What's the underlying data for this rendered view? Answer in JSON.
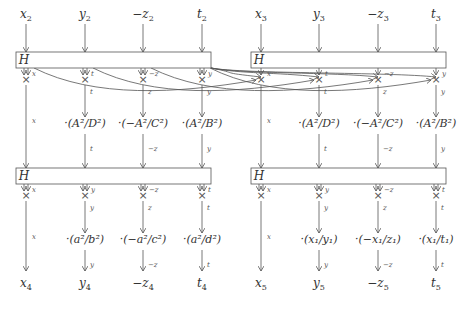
{
  "diagram": {
    "title": "",
    "columns_x": [
      26,
      85,
      143,
      202,
      261,
      319,
      378,
      436
    ],
    "inputs": [
      {
        "main": "x",
        "sub": "2",
        "neg": false
      },
      {
        "main": "y",
        "sub": "2",
        "neg": false
      },
      {
        "main": "z",
        "sub": "2",
        "neg": true
      },
      {
        "main": "t",
        "sub": "2",
        "neg": false
      },
      {
        "main": "x",
        "sub": "3",
        "neg": false
      },
      {
        "main": "y",
        "sub": "3",
        "neg": false
      },
      {
        "main": "z",
        "sub": "3",
        "neg": true
      },
      {
        "main": "t",
        "sub": "3",
        "neg": false
      }
    ],
    "outputs": [
      {
        "main": "x",
        "sub": "4",
        "neg": false
      },
      {
        "main": "y",
        "sub": "4",
        "neg": false
      },
      {
        "main": "z",
        "sub": "4",
        "neg": true
      },
      {
        "main": "t",
        "sub": "4",
        "neg": false
      },
      {
        "main": "x",
        "sub": "5",
        "neg": false
      },
      {
        "main": "y",
        "sub": "5",
        "neg": false
      },
      {
        "main": "z",
        "sub": "5",
        "neg": true
      },
      {
        "main": "t",
        "sub": "5",
        "neg": false
      }
    ],
    "h_boxes": [
      {
        "label": "H",
        "x": 16,
        "y": 52,
        "w": 195,
        "h": 16
      },
      {
        "label": "H",
        "x": 251,
        "y": 52,
        "w": 195,
        "h": 16
      },
      {
        "label": "H",
        "x": 16,
        "y": 168,
        "w": 195,
        "h": 16
      },
      {
        "label": "H",
        "x": 251,
        "y": 168,
        "w": 195,
        "h": 16
      }
    ],
    "stage1_labels": [
      "x",
      "t",
      "−z",
      "y",
      "x",
      "t",
      "−z",
      "y"
    ],
    "stage1b_labels": [
      "",
      "t",
      "z",
      "y",
      "",
      "t",
      "z",
      "y"
    ],
    "mult_row1": [
      "",
      "·(A²/D²)",
      "·(−A²/C²)",
      "·(A²/B²)",
      "",
      "·(A²/D²)",
      "·(−A²/C²)",
      "·(A²/B²)"
    ],
    "mult_row1_side": [
      "x",
      "",
      "",
      "",
      "x",
      "",
      "",
      ""
    ],
    "stage2_labels": [
      "",
      "t",
      "−z",
      "y",
      "",
      "t",
      "−z",
      "y"
    ],
    "stage3_labels": [
      "x",
      "y",
      "−z",
      "t",
      "x",
      "y",
      "−z",
      "t"
    ],
    "stage3b_labels": [
      "",
      "y",
      "z",
      "t",
      "",
      "y",
      "z",
      "t"
    ],
    "mult_row2": [
      "",
      "·(a²/b²)",
      "·(−a²/c²)",
      "·(a²/d²)",
      "",
      "·(x₁/y₁)",
      "·(−x₁/z₁)",
      "·(x₁/t₁)"
    ],
    "mult_row2_side": [
      "x",
      "",
      "",
      "",
      "x",
      "",
      "",
      ""
    ],
    "stage4_labels": [
      "",
      "y",
      "−z",
      "t",
      "",
      "y",
      "−z",
      "t"
    ],
    "cross_symbol": "×",
    "colors": {
      "stroke": "#555555",
      "text": "#333333"
    }
  }
}
